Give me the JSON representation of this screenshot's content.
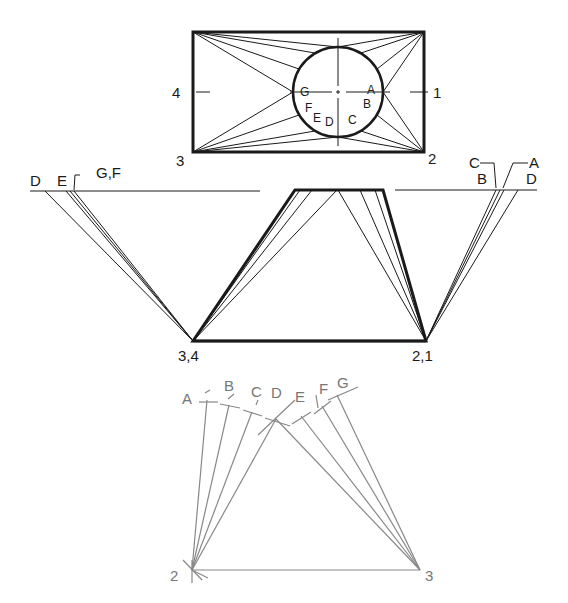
{
  "diagram": {
    "kind": "Oblique cone development by triangulation",
    "colors": {
      "ink": "#1a1a1a",
      "construction": "#888888",
      "paper": "#ffffff"
    }
  },
  "top_view": {
    "rect": {
      "x1": 193,
      "y1": 32,
      "x2": 424,
      "y2": 152
    },
    "circle": {
      "cx": 338,
      "cy": 92,
      "r": 45
    },
    "corner_labels": {
      "c4": "4",
      "c1": "1",
      "c3": "3",
      "c2": "2"
    },
    "circle_labels": {
      "A": "A",
      "B": "B",
      "C": "C",
      "D": "D",
      "E": "E",
      "F": "F",
      "G": "G"
    }
  },
  "front_view": {
    "labels": {
      "left_base": "3,4",
      "right_base": "2,1"
    }
  },
  "true_length_left": {
    "labels": {
      "D": "D",
      "E": "E",
      "GF": "G,F"
    }
  },
  "true_length_right": {
    "labels": {
      "C": "C",
      "B": "B",
      "A": "A",
      "D": "D"
    }
  },
  "development": {
    "labels": {
      "A": "A",
      "B": "B",
      "C": "C",
      "D": "D",
      "E": "E",
      "F": "F",
      "G": "G",
      "p2": "2",
      "p3": "3"
    }
  }
}
